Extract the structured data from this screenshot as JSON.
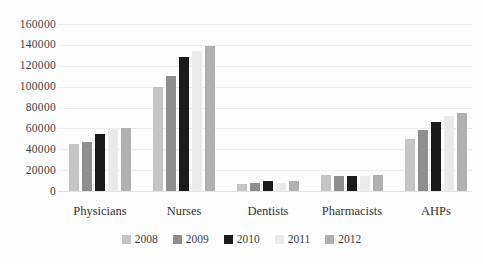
{
  "chart_data": {
    "type": "bar",
    "title": "",
    "xlabel": "",
    "ylabel": "",
    "categories": [
      "Physicians",
      "Nurses",
      "Dentists",
      "Pharmacists",
      "AHPs"
    ],
    "series": [
      {
        "name": "2008",
        "color": "#c5c5c5",
        "values": [
          45000,
          100000,
          7000,
          15000,
          50000
        ]
      },
      {
        "name": "2009",
        "color": "#8e8e8e",
        "values": [
          47000,
          110000,
          8000,
          14000,
          58000
        ]
      },
      {
        "name": "2010",
        "color": "#1b1b1b",
        "values": [
          55000,
          128000,
          10000,
          14000,
          66000
        ]
      },
      {
        "name": "2011",
        "color": "#eaeaea",
        "values": [
          59000,
          134000,
          8000,
          14000,
          72000
        ]
      },
      {
        "name": "2012",
        "color": "#b0b0b0",
        "values": [
          60000,
          139000,
          9500,
          15000,
          75000
        ]
      }
    ],
    "ylim": [
      0,
      160000
    ],
    "ytick_step": 20000,
    "ytick_labels": [
      "0",
      "20000",
      "40000",
      "60000",
      "80000",
      "100000",
      "120000",
      "140000",
      "160000"
    ],
    "grid": true,
    "legend_position": "bottom",
    "colors": {
      "gridline": "#ededed",
      "axis_text": "#3f3f3f",
      "background": "#fdfdfd"
    }
  }
}
